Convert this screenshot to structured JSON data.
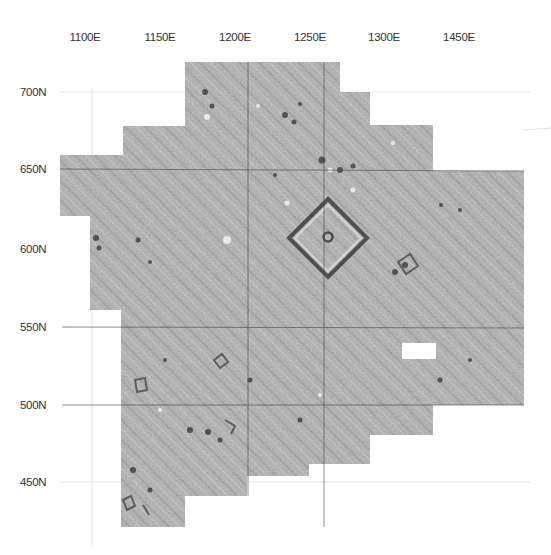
{
  "map": {
    "type": "magnetometry-survey-grid",
    "x_axis": {
      "labels": [
        {
          "text": "1100E",
          "x": 85
        },
        {
          "text": "1150E",
          "x": 160
        },
        {
          "text": "1200E",
          "x": 235
        },
        {
          "text": "1250E",
          "x": 310
        },
        {
          "text": "1300E",
          "x": 384
        },
        {
          "text": "1450E",
          "x": 459
        }
      ]
    },
    "y_axis": {
      "labels": [
        {
          "text": "700N",
          "y": 92
        },
        {
          "text": "650N",
          "y": 169
        },
        {
          "text": "600N",
          "y": 249
        },
        {
          "text": "550N",
          "y": 327
        },
        {
          "text": "500N",
          "y": 405
        },
        {
          "text": "450N",
          "y": 482
        }
      ]
    },
    "colors": {
      "background": "#ffffff",
      "survey_fill": "#a9a9a9",
      "grid_line": "#555555",
      "faint_grid": "#dddddd",
      "label": "#333333"
    },
    "features": [
      {
        "name": "square-enclosure",
        "cx": 328,
        "cy": 237,
        "half_diag": 40
      },
      {
        "name": "blank-data-gap",
        "x": 402,
        "y": 343,
        "w": 34,
        "h": 16
      }
    ]
  }
}
